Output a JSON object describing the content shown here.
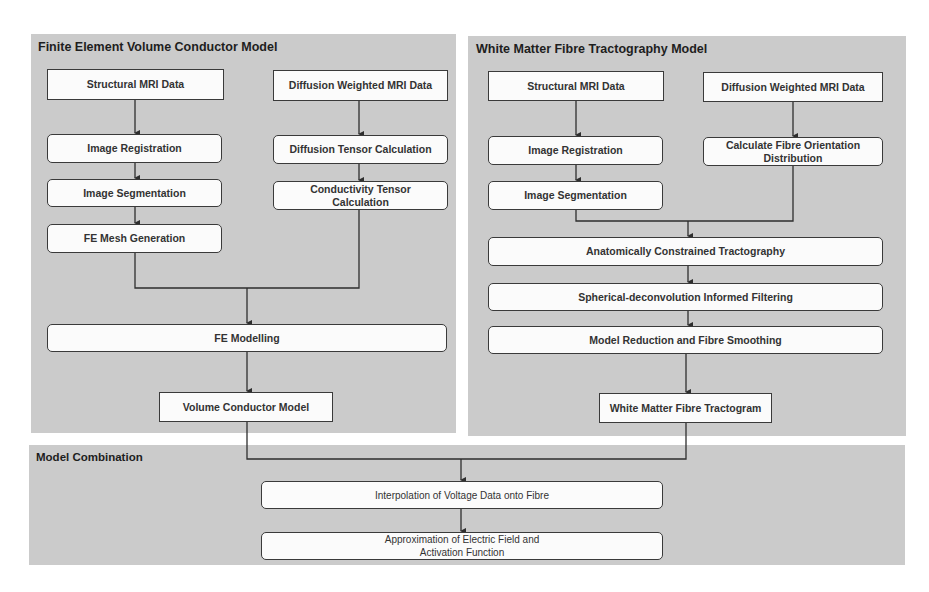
{
  "panels": {
    "fe": {
      "title": "Finite Element Volume Conductor Model",
      "boxes": {
        "structural_mri": "Structural MRI Data",
        "diffusion_mri": "Diffusion Weighted  MRI Data",
        "image_registration": "Image Registration",
        "diffusion_tensor": "Diffusion Tensor Calculation",
        "image_segmentation": "Image Segmentation",
        "conductivity_tensor": "Conductivity Tensor Calculation",
        "fe_mesh": "FE Mesh Generation",
        "fe_modelling": "FE Modelling",
        "volume_conductor": "Volume Conductor Model"
      }
    },
    "wm": {
      "title": "White Matter Fibre Tractography Model",
      "boxes": {
        "structural_mri": "Structural MRI Data",
        "diffusion_mri": "Diffusion Weighted  MRI Data",
        "image_registration": "Image Registration",
        "fod": "Calculate Fibre Orientation Distribution",
        "image_segmentation": "Image Segmentation",
        "act": "Anatomically Constrained Tractography",
        "sift": "Spherical-deconvolution Informed Filtering",
        "model_reduction": "Model Reduction and Fibre Smoothing",
        "tractogram": "White Matter Fibre Tractogram"
      }
    },
    "combo": {
      "title": "Model Combination",
      "boxes": {
        "interpolation": "Interpolation of Voltage Data onto Fibre",
        "approximation": "Approximation of Electric Field and Activation Function"
      }
    }
  },
  "colors": {
    "panel_bg": "#cbcbcb",
    "box_bg": "#fbfbfb",
    "line": "#2e2e2e"
  }
}
